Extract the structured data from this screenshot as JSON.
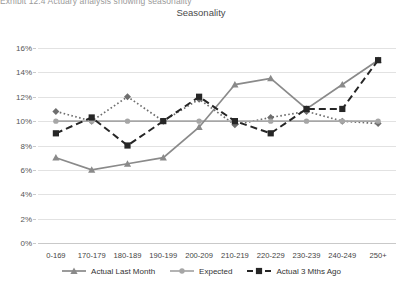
{
  "header": {
    "cut_off_text": "Exhibit 12.4  Actuary analysis showing seasonality"
  },
  "chart_data": {
    "type": "line",
    "title": "Seasonality",
    "xlabel": "",
    "ylabel": "",
    "ylim": [
      0,
      16
    ],
    "ytick_labels": [
      "0%",
      "2%",
      "4%",
      "6%",
      "8%",
      "10%",
      "12%",
      "14%",
      "16%"
    ],
    "ytick_values": [
      0,
      2,
      4,
      6,
      8,
      10,
      12,
      14,
      16
    ],
    "grid": true,
    "legend_position": "bottom",
    "categories": [
      "0-169",
      "170-179",
      "180-189",
      "190-199",
      "200-209",
      "210-219",
      "220-229",
      "230-239",
      "240-249",
      "250+"
    ],
    "series": [
      {
        "name": "Actual Last Month",
        "color": "#8a8a8a",
        "marker": "triangle",
        "line_style": "solid",
        "values": [
          7.0,
          6.0,
          6.5,
          7.0,
          9.5,
          13.0,
          13.5,
          11.0,
          13.0,
          15.0
        ]
      },
      {
        "name": "Expected",
        "color": "#a6a6a6",
        "marker": "circle",
        "line_style": "solid",
        "values": [
          10.0,
          10.0,
          10.0,
          10.0,
          10.0,
          10.0,
          10.0,
          10.0,
          10.0,
          10.0
        ]
      },
      {
        "name": "Actual 3 Mths Ago",
        "color": "#262626",
        "marker": "square",
        "line_style": "dashed",
        "values": [
          9.0,
          10.3,
          8.0,
          10.0,
          12.0,
          10.0,
          9.0,
          11.0,
          11.0,
          15.0
        ]
      },
      {
        "name": "Expected Dotted",
        "color": "#6e6e6e",
        "marker": "diamond",
        "line_style": "dotted",
        "values": [
          10.8,
          10.0,
          12.0,
          10.0,
          11.8,
          9.7,
          10.3,
          10.8,
          10.0,
          9.8
        ],
        "in_legend": false
      }
    ]
  },
  "legend": {
    "items": [
      {
        "label": "Actual Last Month"
      },
      {
        "label": "Expected"
      },
      {
        "label": "Actual 3 Mths Ago"
      }
    ]
  }
}
